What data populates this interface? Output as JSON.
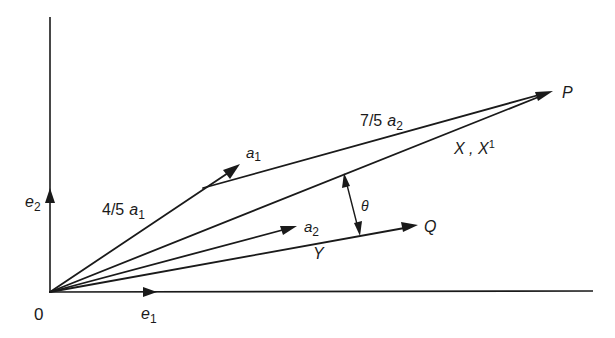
{
  "diagram": {
    "type": "vector-diagram",
    "origin_label": "0",
    "basis": {
      "e1": {
        "label": "e",
        "sub": "1"
      },
      "e2": {
        "label": "e",
        "sub": "2"
      }
    },
    "vectors": {
      "a1": {
        "label": "a",
        "sub": "1"
      },
      "a2": {
        "label": "a",
        "sub": "2"
      },
      "a1_scaled": {
        "coef": "4/5",
        "label": "a",
        "sub": "1"
      },
      "a2_scaled": {
        "coef": "7/5",
        "label": "a",
        "sub": "2"
      }
    },
    "points": {
      "P": "P",
      "Q": "Q"
    },
    "lines": {
      "X": {
        "label": "X , X",
        "sup": "1"
      },
      "Y": "Y"
    },
    "angle": "θ"
  }
}
